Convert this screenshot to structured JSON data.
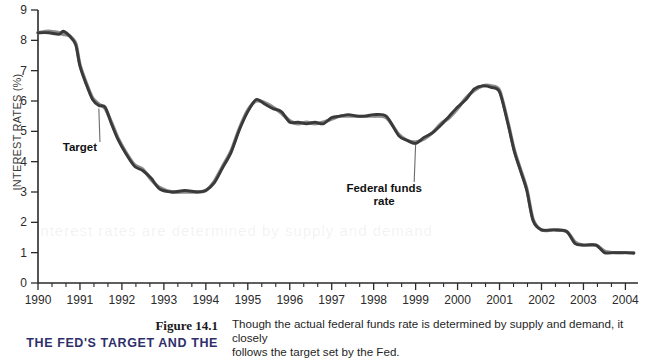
{
  "figure": {
    "number": "Figure 14.1",
    "headline": "THE FED'S TARGET AND THE",
    "caption_line1": "Though the actual federal funds rate is determined by supply and demand, it closely",
    "caption_line2": "follows the target set by the Fed."
  },
  "watermark": {
    "text": "interest rates are determined by supply and demand"
  },
  "annotations": {
    "target": "Target",
    "ffr_line1": "Federal funds",
    "ffr_line2": "rate"
  },
  "colors": {
    "target_series": "#8d8d8d",
    "ffr_series": "#3a3a3a",
    "axis": "#2a2a2a",
    "headline": "#2f2f6a"
  },
  "chart_data": {
    "type": "line",
    "title": "",
    "xlabel": "",
    "ylabel": "INTEREST RATES (%)",
    "xlim": [
      1990,
      2004.3
    ],
    "ylim": [
      0,
      9
    ],
    "yticks": [
      0,
      1,
      2,
      3,
      4,
      5,
      6,
      7,
      8,
      9
    ],
    "xticks": [
      1990,
      1991,
      1992,
      1993,
      1994,
      1995,
      1996,
      1997,
      1998,
      1999,
      2000,
      2001,
      2002,
      2003,
      2004
    ],
    "minor_xticks_per_year": 2,
    "grid": false,
    "legend": "none",
    "annotations": [
      {
        "label": "Target",
        "x": 1991.0,
        "y": 4.35,
        "points_to": {
          "x": 1991.45,
          "y": 5.85
        }
      },
      {
        "label": "Federal funds rate",
        "x": 1998.25,
        "y": 3.0,
        "points_to": {
          "x": 1999.0,
          "y": 4.7
        }
      }
    ],
    "series": [
      {
        "name": "Target",
        "color": "#8d8d8d",
        "x": [
          1990.0,
          1990.25,
          1990.5,
          1990.6,
          1990.75,
          1990.9,
          1991.0,
          1991.15,
          1991.3,
          1991.45,
          1991.6,
          1991.75,
          1991.9,
          1992.1,
          1992.3,
          1992.5,
          1992.7,
          1992.9,
          1993.2,
          1993.5,
          1993.8,
          1994.0,
          1994.2,
          1994.4,
          1994.6,
          1994.8,
          1995.0,
          1995.2,
          1995.4,
          1995.6,
          1995.8,
          1996.0,
          1996.2,
          1996.4,
          1996.6,
          1996.8,
          1997.0,
          1997.2,
          1997.4,
          1997.6,
          1997.8,
          1998.0,
          1998.3,
          1998.6,
          1998.8,
          1999.0,
          1999.2,
          1999.4,
          1999.6,
          1999.8,
          2000.0,
          2000.2,
          2000.4,
          2000.6,
          2000.8,
          2001.0,
          2001.2,
          2001.35,
          2001.5,
          2001.65,
          2001.8,
          2002.0,
          2002.3,
          2002.6,
          2002.8,
          2003.0,
          2003.3,
          2003.5,
          2003.7,
          2004.0,
          2004.2
        ],
        "y": [
          8.25,
          8.3,
          8.25,
          8.2,
          8.15,
          7.9,
          7.2,
          6.6,
          6.1,
          5.9,
          5.75,
          5.3,
          4.8,
          4.3,
          3.9,
          3.75,
          3.4,
          3.15,
          3.0,
          3.0,
          3.0,
          3.05,
          3.35,
          3.85,
          4.35,
          5.1,
          5.7,
          6.0,
          5.95,
          5.8,
          5.6,
          5.35,
          5.25,
          5.3,
          5.25,
          5.3,
          5.4,
          5.5,
          5.5,
          5.5,
          5.5,
          5.5,
          5.45,
          4.9,
          4.7,
          4.65,
          4.75,
          4.95,
          5.25,
          5.45,
          5.75,
          6.1,
          6.35,
          6.5,
          6.5,
          6.35,
          5.3,
          4.4,
          3.75,
          3.1,
          2.1,
          1.75,
          1.75,
          1.7,
          1.35,
          1.25,
          1.25,
          1.05,
          1.0,
          1.0,
          1.0
        ]
      },
      {
        "name": "Federal funds rate",
        "color": "#3a3a3a",
        "x": [
          1990.0,
          1990.25,
          1990.5,
          1990.6,
          1990.75,
          1990.9,
          1991.0,
          1991.15,
          1991.3,
          1991.45,
          1991.6,
          1991.75,
          1991.9,
          1992.1,
          1992.3,
          1992.5,
          1992.7,
          1992.9,
          1993.2,
          1993.5,
          1993.8,
          1994.0,
          1994.2,
          1994.4,
          1994.6,
          1994.8,
          1995.0,
          1995.2,
          1995.4,
          1995.6,
          1995.8,
          1996.0,
          1996.2,
          1996.4,
          1996.6,
          1996.8,
          1997.0,
          1997.2,
          1997.4,
          1997.6,
          1997.8,
          1998.0,
          1998.3,
          1998.6,
          1998.8,
          1999.0,
          1999.2,
          1999.4,
          1999.6,
          1999.8,
          2000.0,
          2000.2,
          2000.4,
          2000.6,
          2000.8,
          2001.0,
          2001.2,
          2001.35,
          2001.5,
          2001.65,
          2001.8,
          2002.0,
          2002.3,
          2002.6,
          2002.8,
          2003.0,
          2003.3,
          2003.5,
          2003.7,
          2004.0,
          2004.2
        ],
        "y": [
          8.25,
          8.25,
          8.2,
          8.3,
          8.15,
          7.85,
          7.15,
          6.55,
          6.05,
          5.85,
          5.8,
          5.25,
          4.75,
          4.25,
          3.85,
          3.7,
          3.45,
          3.1,
          3.0,
          3.05,
          3.0,
          3.05,
          3.3,
          3.8,
          4.3,
          5.05,
          5.65,
          6.05,
          5.9,
          5.75,
          5.65,
          5.3,
          5.3,
          5.25,
          5.3,
          5.25,
          5.45,
          5.5,
          5.55,
          5.5,
          5.5,
          5.55,
          5.5,
          4.85,
          4.7,
          4.6,
          4.8,
          4.95,
          5.2,
          5.5,
          5.8,
          6.05,
          6.4,
          6.5,
          6.45,
          6.3,
          5.25,
          4.35,
          3.7,
          3.05,
          2.05,
          1.75,
          1.75,
          1.7,
          1.3,
          1.25,
          1.25,
          1.0,
          1.0,
          1.0,
          0.98
        ]
      }
    ]
  }
}
